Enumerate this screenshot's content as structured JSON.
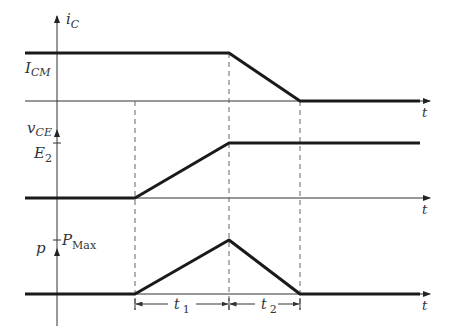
{
  "diagram": {
    "type": "timing-waveform",
    "colors": {
      "line": "#1a1a1a",
      "axis": "#333333",
      "dashed": "#666666",
      "text": "#333333"
    }
  },
  "panels": [
    {
      "id": "ic",
      "axis_label": {
        "main": "i",
        "sub": "C"
      },
      "level_label": {
        "main": "I",
        "sub": "CM"
      },
      "time_label": "t",
      "waveform": "high until end of t1, ramps down to zero at end of t2"
    },
    {
      "id": "vce",
      "axis_label": {
        "main": "v",
        "sub": "CE"
      },
      "level_label": {
        "main": "E",
        "sub": "2"
      },
      "time_label": "t",
      "waveform": "zero until start of t1, ramps up to E2 at end of t1, then constant"
    },
    {
      "id": "p",
      "axis_label": {
        "main": "p",
        "sub": ""
      },
      "level_label": {
        "main": "P",
        "sub": "Max"
      },
      "time_label": "t",
      "waveform": "triangle: rises during t1 to PMax, falls during t2 to zero"
    }
  ],
  "intervals": [
    {
      "main": "t",
      "sub": "1"
    },
    {
      "main": "t",
      "sub": "2"
    }
  ]
}
